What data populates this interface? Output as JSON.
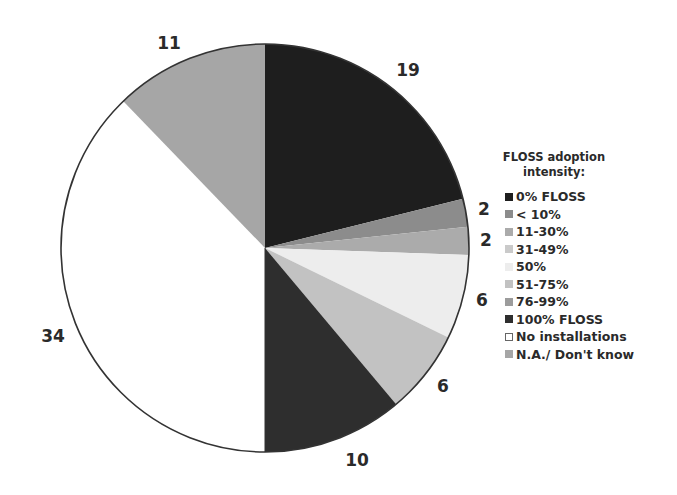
{
  "chart_data": {
    "type": "pie",
    "title": "",
    "start_angle_deg": 0,
    "direction": "clockwise",
    "legend_title": "FLOSS adoption intensity:",
    "legend_position": "right",
    "categories": [
      "0% FLOSS",
      "< 10%",
      "11-30%",
      "31-49%",
      "50%",
      "51-75%",
      "76-99%",
      "100% FLOSS",
      "No installations",
      "N.A./ Don't know"
    ],
    "values": [
      19,
      2,
      2,
      0,
      6,
      6,
      0,
      10,
      34,
      11
    ],
    "colors": [
      "#1e1e1e",
      "#8c8c8c",
      "#ababab",
      "#cacaca",
      "#ededed",
      "#c2c2c2",
      "#9c9c9c",
      "#2e2e2e",
      "#ffffff",
      "#a6a6a6"
    ],
    "data_labels": [
      "19",
      "2",
      "2",
      "",
      "6",
      "6",
      "",
      "10",
      "34",
      "11"
    ],
    "total": 90
  },
  "legend": {
    "title_line1": "FLOSS adoption",
    "title_line2": "intensity:",
    "items": [
      {
        "label": "0% FLOSS",
        "color": "#1e1e1e"
      },
      {
        "label": "< 10%",
        "color": "#8c8c8c"
      },
      {
        "label": "11-30%",
        "color": "#ababab"
      },
      {
        "label": "31-49%",
        "color": "#cacaca"
      },
      {
        "label": "50%",
        "color": "#ededed"
      },
      {
        "label": "51-75%",
        "color": "#c2c2c2"
      },
      {
        "label": "76-99%",
        "color": "#9c9c9c"
      },
      {
        "label": "100% FLOSS",
        "color": "#2e2e2e"
      },
      {
        "label": "No installations",
        "color": "#ffffff"
      },
      {
        "label": "N.A./ Don't know",
        "color": "#a6a6a6"
      }
    ]
  },
  "labels": [
    {
      "text": "19",
      "x": 408,
      "y": 70
    },
    {
      "text": "2",
      "x": 484,
      "y": 209
    },
    {
      "text": "2",
      "x": 486,
      "y": 240
    },
    {
      "text": "6",
      "x": 482,
      "y": 300
    },
    {
      "text": "6",
      "x": 443,
      "y": 386
    },
    {
      "text": "10",
      "x": 357,
      "y": 460
    },
    {
      "text": "34",
      "x": 53,
      "y": 336
    },
    {
      "text": "11",
      "x": 169,
      "y": 43
    }
  ]
}
